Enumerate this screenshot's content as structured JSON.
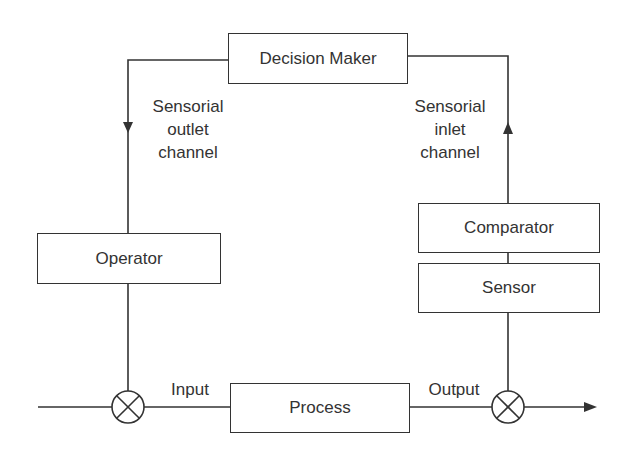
{
  "diagram": {
    "blocks": {
      "decision_maker": "Decision Maker",
      "operator": "Operator",
      "comparator": "Comparator",
      "sensor": "Sensor",
      "process": "Process"
    },
    "labels": {
      "outlet": [
        "Sensorial",
        "outlet",
        "channel"
      ],
      "inlet": [
        "Sensorial",
        "inlet",
        "channel"
      ],
      "input": "Input",
      "output": "Output"
    },
    "junctions": [
      "summing-junction-input",
      "summing-junction-output"
    ],
    "colors": {
      "line": "#333333",
      "text": "#333333",
      "background": "#ffffff"
    }
  }
}
